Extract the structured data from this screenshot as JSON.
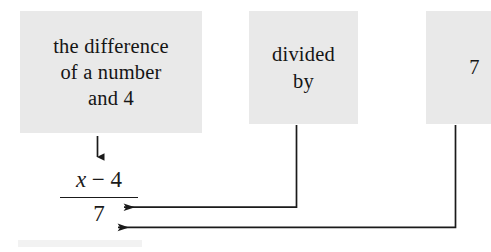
{
  "diagram": {
    "title": "the difference of a number and 4 divided by 7",
    "boxes": [
      {
        "name": "difference-phrase",
        "lines": [
          "the difference",
          "of a number",
          "and 4"
        ],
        "fill": "#e9e9e9"
      },
      {
        "name": "divided-by-phrase",
        "lines": [
          "divided",
          "by"
        ],
        "fill": "#e9e9e9"
      },
      {
        "name": "seven-phrase",
        "lines": [
          "7"
        ],
        "fill": "#e9e9e9"
      }
    ],
    "expression": {
      "numerator_var": "x",
      "numerator_operator": "−",
      "numerator_operand": "4",
      "numerator_full": "x − 4",
      "denominator": "7"
    },
    "connectors": [
      {
        "name": "difference-to-numerator",
        "kind": "arrow-down"
      },
      {
        "name": "divided-by-to-fraction-bar",
        "kind": "elbow-arrow-left"
      },
      {
        "name": "seven-to-denominator",
        "kind": "elbow-arrow-left"
      }
    ],
    "colors": {
      "box_fill": "#e9e9e9",
      "ink": "#1a1a1a",
      "page": "#ffffff"
    }
  }
}
